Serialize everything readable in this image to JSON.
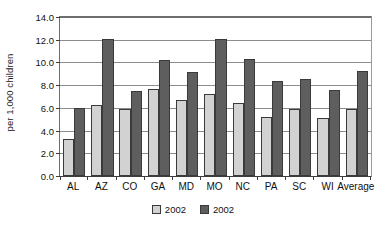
{
  "chart_data": {
    "type": "bar",
    "title": "",
    "xlabel": "",
    "ylabel": "per 1,000 children",
    "ylim": [
      0.0,
      14.0
    ],
    "ytick_step": 2.0,
    "ytick_labels": [
      "0.0",
      "2.0",
      "4.0",
      "6.0",
      "8.0",
      "10.0",
      "12.0",
      "14.0"
    ],
    "ytick_values": [
      0.0,
      2.0,
      4.0,
      6.0,
      8.0,
      10.0,
      12.0,
      14.0
    ],
    "grid": "horizontal",
    "legend_position": "bottom-center",
    "categories": [
      "AL",
      "AZ",
      "CO",
      "GA",
      "MD",
      "MO",
      "NC",
      "PA",
      "SC",
      "WI",
      "Average"
    ],
    "series": [
      {
        "name": "2002",
        "color": "#d2d2d2",
        "values": [
          3.3,
          6.25,
          5.9,
          7.65,
          6.7,
          7.25,
          6.45,
          5.2,
          5.9,
          5.15,
          5.9
        ]
      },
      {
        "name": "2002",
        "color": "#5e5e5e",
        "values": [
          6.0,
          12.05,
          7.5,
          10.2,
          9.2,
          12.1,
          10.3,
          8.35,
          8.55,
          7.55,
          9.25
        ]
      }
    ]
  },
  "legend": {
    "entries": [
      {
        "label": "2002",
        "swatch": "series-a"
      },
      {
        "label": "2002",
        "swatch": "series-b"
      }
    ]
  }
}
